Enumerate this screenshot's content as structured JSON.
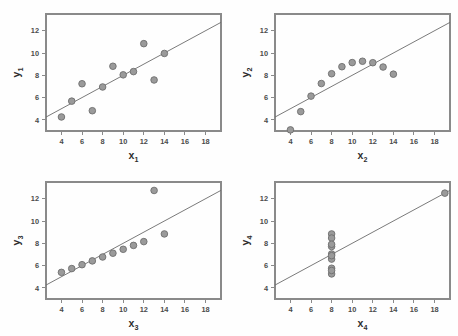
{
  "figure": {
    "background_color": "#fefefe",
    "marker_fill": "#9a9a9a",
    "marker_stroke": "#6e6e6e",
    "line_color": "#6b6b6b",
    "axis_color": "#8a8a8a",
    "panel_count": 4
  },
  "chart_data": [
    {
      "type": "scatter",
      "title": "",
      "xlabel": "x",
      "xlabel_sub": "1",
      "ylabel": "y",
      "ylabel_sub": "1",
      "xlim": [
        2.5,
        19.5
      ],
      "ylim": [
        3.0,
        13.5
      ],
      "xticks": [
        4,
        6,
        8,
        10,
        12,
        14,
        16,
        18
      ],
      "yticks": [
        4,
        6,
        8,
        10,
        12
      ],
      "grid": false,
      "legend": "none",
      "x": [
        10,
        8,
        13,
        9,
        11,
        14,
        6,
        4,
        12,
        7,
        5
      ],
      "y": [
        8.04,
        6.95,
        7.58,
        8.81,
        8.33,
        9.96,
        7.24,
        4.26,
        10.84,
        4.82,
        5.68
      ],
      "fit": {
        "intercept": 3.0,
        "slope": 0.5,
        "x_start": 2.5,
        "x_end": 19.5
      }
    },
    {
      "type": "scatter",
      "title": "",
      "xlabel": "x",
      "xlabel_sub": "2",
      "ylabel": "y",
      "ylabel_sub": "2",
      "xlim": [
        2.5,
        19.5
      ],
      "ylim": [
        3.0,
        13.5
      ],
      "xticks": [
        4,
        6,
        8,
        10,
        12,
        14,
        16,
        18
      ],
      "yticks": [
        4,
        6,
        8,
        10,
        12
      ],
      "grid": false,
      "legend": "none",
      "x": [
        10,
        8,
        13,
        9,
        11,
        14,
        6,
        4,
        12,
        7,
        5
      ],
      "y": [
        9.14,
        8.14,
        8.74,
        8.77,
        9.26,
        8.1,
        6.13,
        3.1,
        9.13,
        7.26,
        4.74
      ],
      "fit": {
        "intercept": 3.0,
        "slope": 0.5,
        "x_start": 2.5,
        "x_end": 19.5
      }
    },
    {
      "type": "scatter",
      "title": "",
      "xlabel": "x",
      "xlabel_sub": "3",
      "ylabel": "y",
      "ylabel_sub": "3",
      "xlim": [
        2.5,
        19.5
      ],
      "ylim": [
        3.0,
        13.5
      ],
      "xticks": [
        4,
        6,
        8,
        10,
        12,
        14,
        16,
        18
      ],
      "yticks": [
        4,
        6,
        8,
        10,
        12
      ],
      "grid": false,
      "legend": "none",
      "x": [
        10,
        8,
        13,
        9,
        11,
        14,
        6,
        4,
        12,
        7,
        5
      ],
      "y": [
        7.46,
        6.77,
        12.74,
        7.11,
        7.81,
        8.84,
        6.08,
        5.39,
        8.15,
        6.42,
        5.73
      ],
      "fit": {
        "intercept": 3.0,
        "slope": 0.5,
        "x_start": 2.5,
        "x_end": 19.5
      }
    },
    {
      "type": "scatter",
      "title": "",
      "xlabel": "x",
      "xlabel_sub": "4",
      "ylabel": "y",
      "ylabel_sub": "4",
      "xlim": [
        2.5,
        19.5
      ],
      "ylim": [
        3.0,
        13.5
      ],
      "xticks": [
        4,
        6,
        8,
        10,
        12,
        14,
        16,
        18
      ],
      "yticks": [
        4,
        6,
        8,
        10,
        12
      ],
      "grid": false,
      "legend": "none",
      "x": [
        8,
        8,
        8,
        8,
        8,
        8,
        8,
        19,
        8,
        8,
        8
      ],
      "y": [
        6.58,
        5.76,
        7.71,
        8.84,
        8.47,
        7.04,
        5.25,
        12.5,
        5.56,
        7.91,
        6.89
      ],
      "fit": {
        "intercept": 3.0,
        "slope": 0.5,
        "x_start": 2.5,
        "x_end": 19.5
      }
    }
  ]
}
